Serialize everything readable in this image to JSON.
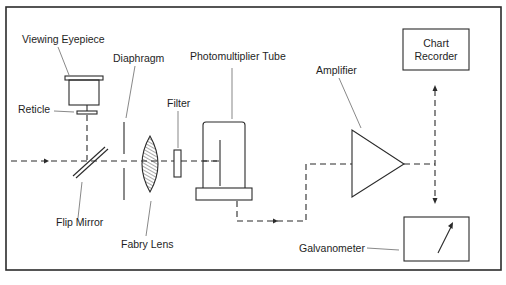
{
  "diagram": {
    "type": "optical-electronic schematic",
    "labels": {
      "viewing_eyepiece": "Viewing Eyepiece",
      "reticle": "Reticle",
      "diaphragm": "Diaphragm",
      "photomultiplier_tube": "Photomultiplier Tube",
      "filter": "Filter",
      "flip_mirror": "Flip Mirror",
      "fabry_lens": "Fabry Lens",
      "amplifier": "Amplifier",
      "chart_recorder_line1": "Chart",
      "chart_recorder_line2": "Recorder",
      "galvanometer": "Galvanometer"
    },
    "flow": [
      "Light path (dashed) enters from left",
      "Flip Mirror (optionally diverts to Viewing Eyepiece / Reticle)",
      "Diaphragm",
      "Fabry Lens",
      "Filter",
      "Photomultiplier Tube",
      "Amplifier",
      "Chart Recorder / Galvanometer"
    ],
    "colors": {
      "line": "#2a2a2a",
      "background": "#ffffff",
      "text": "#1e1e1e"
    }
  }
}
